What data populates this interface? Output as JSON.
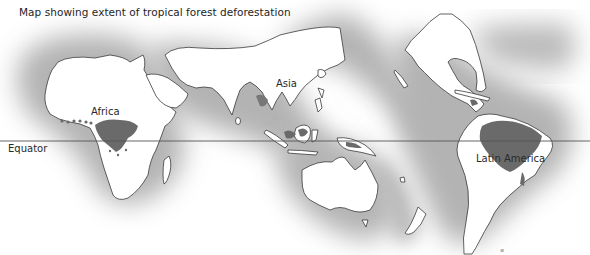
{
  "title": "Map showing extent of tropical forest deforestation",
  "labels": {
    "equator": "Equator",
    "africa": "Africa",
    "asia": "Asia",
    "latin_america": "Latin America"
  },
  "colors": {
    "land": "#ffffff",
    "coast_outline": "#3a3a3a",
    "ocean_halo": "#8c8c8c",
    "forest_extent": "#6e6e6e",
    "equator_line": "#555555",
    "background": "#ffffff"
  },
  "legend_note": "Dark shaded areas within continents indicate tropical forest extent"
}
